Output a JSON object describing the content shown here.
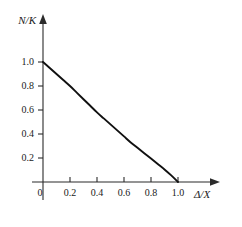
{
  "chart_data": {
    "type": "line",
    "title": "",
    "subtitle": "",
    "xlabel": "Δ/X",
    "ylabel": "N/K",
    "xlim": [
      -0.06,
      1.22
    ],
    "ylim": [
      -0.05,
      1.18
    ],
    "grid": false,
    "legend": null,
    "x_ticks": [
      0,
      0.2,
      0.4,
      0.6,
      0.8,
      1.0
    ],
    "x_tick_labels": [
      "0",
      "0.2",
      "0.4",
      "0.6",
      "0.8",
      "1.0"
    ],
    "y_ticks": [
      0.2,
      0.4,
      0.6,
      0.8,
      1.0
    ],
    "y_tick_labels": [
      "0.2",
      "0.4",
      "0.6",
      "0.8",
      "1.0"
    ],
    "axis_style": "arrow-tipped open axes",
    "series": [
      {
        "name": "N/K vs Δ/X",
        "color": "#101010",
        "x": [
          0.0,
          0.05,
          0.1,
          0.15,
          0.2,
          0.25,
          0.3,
          0.35,
          0.4,
          0.45,
          0.5,
          0.55,
          0.6,
          0.65,
          0.7,
          0.75,
          0.8,
          0.85,
          0.9,
          0.95,
          1.0
        ],
        "y": [
          1.0,
          0.95,
          0.9,
          0.85,
          0.8,
          0.745,
          0.69,
          0.635,
          0.58,
          0.53,
          0.48,
          0.43,
          0.38,
          0.33,
          0.285,
          0.24,
          0.195,
          0.15,
          0.105,
          0.055,
          0.0
        ]
      }
    ],
    "annotations": []
  },
  "labels": {
    "y_axis_title": "N/K",
    "x_axis_title": "Δ/X",
    "x_tick_0": "0",
    "x_tick_1": "0.2",
    "x_tick_2": "0.4",
    "x_tick_3": "0.6",
    "x_tick_4": "0.8",
    "x_tick_5": "1.0",
    "y_tick_0": "0.2",
    "y_tick_1": "0.4",
    "y_tick_2": "0.6",
    "y_tick_3": "0.8",
    "y_tick_4": "1.0"
  },
  "colors": {
    "background": "#ffffff",
    "axis": "#2b2b2b",
    "curve": "#101010",
    "text": "#1a1a1a"
  }
}
